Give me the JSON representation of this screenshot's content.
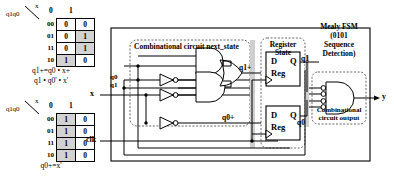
{
  "kmaps": [
    {
      "name": "q1-next-kmap",
      "row_label": "q1q0",
      "col_var": "x",
      "col_headers": [
        "0",
        "1"
      ],
      "row_headers": [
        "00",
        "01",
        "11",
        "10"
      ],
      "cells": [
        [
          {
            "v": "0",
            "shaded": false
          },
          {
            "v": "0",
            "shaded": false
          }
        ],
        [
          {
            "v": "0",
            "shaded": false
          },
          {
            "v": "1",
            "shaded": true
          }
        ],
        [
          {
            "v": "0",
            "shaded": false
          },
          {
            "v": "1",
            "shaded": true
          }
        ],
        [
          {
            "v": "1",
            "shaded": true
          },
          {
            "v": "0",
            "shaded": false
          }
        ]
      ],
      "equation": [
        "q1+=q0 • x+",
        "q1 • q0' • x'"
      ]
    },
    {
      "name": "q0-next-kmap",
      "row_label": "q1q0",
      "col_var": "x",
      "col_headers": [
        "0",
        "1"
      ],
      "row_headers": [
        "00",
        "01",
        "11",
        "10"
      ],
      "cells": [
        [
          {
            "v": "1",
            "shaded": true
          },
          {
            "v": "0",
            "shaded": false
          }
        ],
        [
          {
            "v": "1",
            "shaded": true
          },
          {
            "v": "0",
            "shaded": false
          }
        ],
        [
          {
            "v": "1",
            "shaded": true
          },
          {
            "v": "0",
            "shaded": false
          }
        ],
        [
          {
            "v": "1",
            "shaded": true
          },
          {
            "v": "0",
            "shaded": false
          }
        ]
      ],
      "equation": [
        "q0+=x'"
      ]
    }
  ],
  "circuit": {
    "title_lines": [
      "Mealy FSM",
      "(0101",
      "Sequence",
      "Detection)"
    ],
    "blocks": {
      "next_state": "Combinational circuit next_state",
      "register_state_l1": "Register",
      "register_state_l2": "State",
      "output_l1": "Combinational",
      "output_l2": "circuit output"
    },
    "inputs": {
      "x": "x",
      "clk": "clk",
      "q0": "q0",
      "q1": "q1"
    },
    "outputs": {
      "y": "y"
    },
    "nets": {
      "q1_next": "q1+",
      "q0_next": "q0+",
      "q1": "q1",
      "q0": "q0"
    },
    "register": {
      "d": "D",
      "q": "Q",
      "reg": "Reg"
    }
  }
}
